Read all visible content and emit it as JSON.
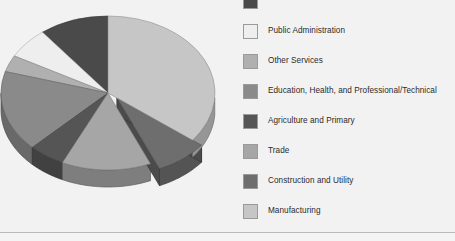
{
  "chart_data": {
    "type": "pie",
    "title": "",
    "three_d": true,
    "legend_position": "right",
    "categories": [
      "Information and Financial Activities",
      "Public Administration",
      "Other Services",
      "Education, Health, and Professional/Technical",
      "Agriculture and Primary",
      "Trade",
      "Construction and Utility",
      "Manufacturing"
    ],
    "values": [
      10.5,
      6.5,
      3.5,
      17.0,
      5.5,
      13.5,
      8.0,
      35.5
    ],
    "colors": [
      "#4a4a4a",
      "#eeeeee",
      "#b0b0b0",
      "#8a8a8a",
      "#555555",
      "#a6a6a6",
      "#6e6e6e",
      "#c6c6c6"
    ],
    "start_angle": 90,
    "exploded_slice": "Construction and Utility"
  },
  "legend": {
    "items": [
      {
        "label": "",
        "color": "#4a4a4a"
      },
      {
        "label": "Public Administration",
        "color": "#eeeeee"
      },
      {
        "label": "Other Services",
        "color": "#b0b0b0"
      },
      {
        "label": "Education, Health, and Professional/Technical",
        "color": "#8a8a8a"
      },
      {
        "label": "Agriculture and Primary",
        "color": "#555555"
      },
      {
        "label": "Trade",
        "color": "#a6a6a6"
      },
      {
        "label": "Construction and Utility",
        "color": "#6e6e6e"
      },
      {
        "label": "Manufacturing",
        "color": "#c6c6c6"
      }
    ]
  },
  "theme": {
    "background": "#f2f2f2",
    "divider": "#b9b9b9",
    "text": "#2b2b2b"
  }
}
